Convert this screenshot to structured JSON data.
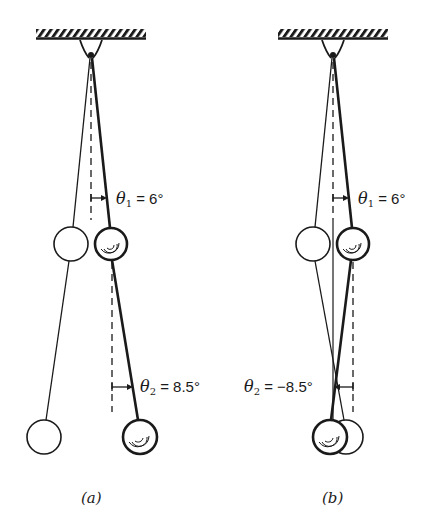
{
  "figure": {
    "panels": [
      {
        "id": "a",
        "caption": "(a)",
        "theta1": {
          "symbol": "θ",
          "sub": "1",
          "text": " = 6°",
          "value_deg": 6
        },
        "theta2": {
          "symbol": "θ",
          "sub": "2",
          "text": " = 8.5°",
          "value_deg": 8.5
        },
        "description": "Double pendulum: initial (white) and displaced (shaded) positions, lower segment deflected further in same direction"
      },
      {
        "id": "b",
        "caption": "(b)",
        "theta1": {
          "symbol": "θ",
          "sub": "1",
          "text": " = 6°",
          "value_deg": 6
        },
        "theta2": {
          "symbol": "θ",
          "sub": "2",
          "text": " = −8.5°",
          "value_deg": -8.5
        },
        "description": "Double pendulum: lower segment deflected in opposite direction"
      }
    ],
    "colors": {
      "ink": "#1a1a1a",
      "background": "#ffffff"
    }
  }
}
